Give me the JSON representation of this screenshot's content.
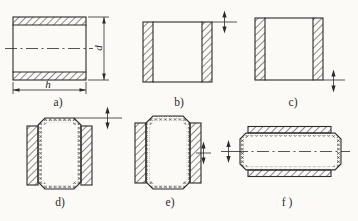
{
  "figure": {
    "type": "engineering-diagram",
    "description_visible_text_only": true,
    "panels": [
      {
        "id": "a",
        "label": "a)"
      },
      {
        "id": "b",
        "label": "b)"
      },
      {
        "id": "c",
        "label": "c)"
      },
      {
        "id": "d",
        "label": "d)"
      },
      {
        "id": "e",
        "label": "e)"
      },
      {
        "id": "f",
        "label": "f )"
      }
    ],
    "dimensions": {
      "diameter_label": "d",
      "height_label": "h"
    },
    "colors": {
      "background": "#fbfaf6",
      "line": "#2b2b2b"
    }
  }
}
